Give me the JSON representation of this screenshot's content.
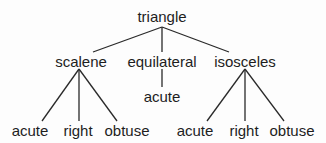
{
  "diagram": {
    "type": "tree",
    "colors": {
      "text": "#1e1e1e",
      "edge": "#2a2a2a",
      "background": "#fdfdfd"
    },
    "root": {
      "label": "triangle",
      "children": [
        {
          "label": "scalene",
          "children": [
            {
              "label": "acute"
            },
            {
              "label": "right"
            },
            {
              "label": "obtuse"
            }
          ]
        },
        {
          "label": "equilateral",
          "children": [
            {
              "label": "acute"
            }
          ]
        },
        {
          "label": "isosceles",
          "children": [
            {
              "label": "acute"
            },
            {
              "label": "right"
            },
            {
              "label": "obtuse"
            }
          ]
        }
      ]
    }
  }
}
